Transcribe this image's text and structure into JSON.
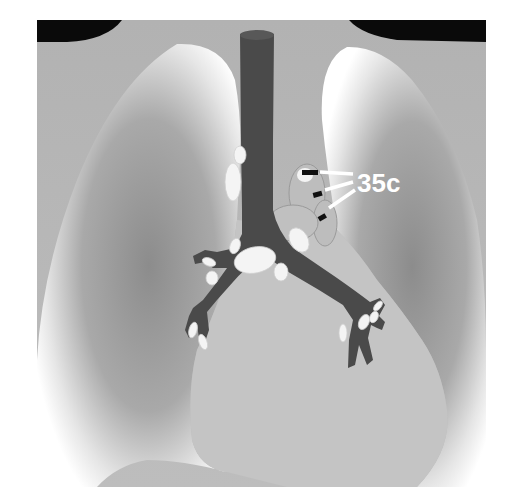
{
  "figure": {
    "annotation": {
      "label": "35c",
      "target": "lymph-node-station-left-hilar"
    },
    "colors": {
      "background": "#b4b4b4",
      "shoulder_dark": "#0a0a0a",
      "airway": "#4a4a4a",
      "node_fill": "#f4f4f4",
      "lung_highlight": "#ffffff",
      "lung_shadow": "#8a8a8a",
      "marker": "#111111",
      "label": "#ffffff"
    }
  }
}
